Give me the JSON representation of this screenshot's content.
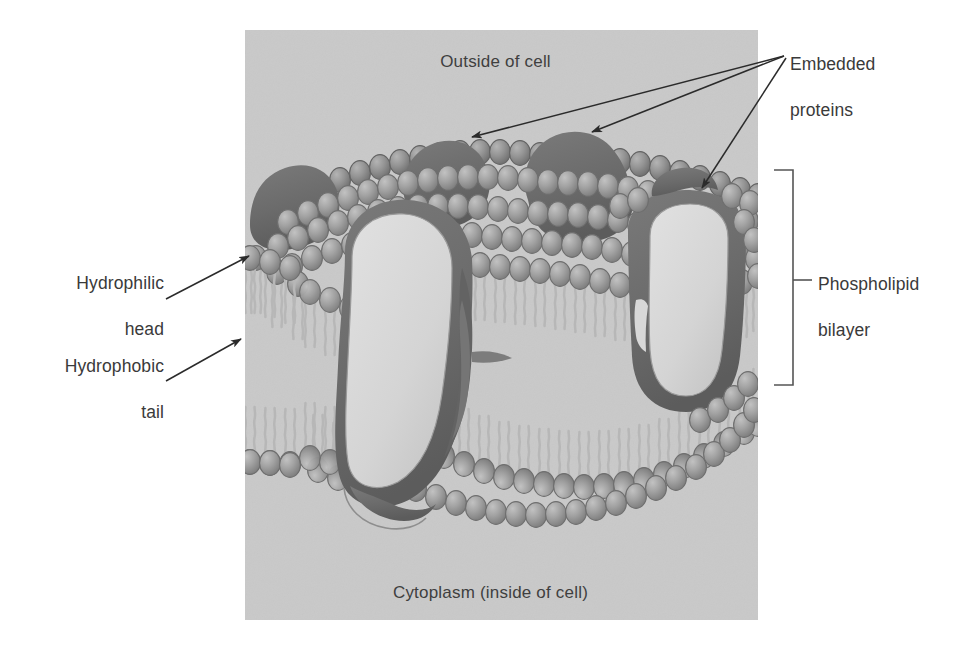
{
  "figure": {
    "panel": {
      "background_color": "#c9c9c9",
      "x": 245,
      "y": 30,
      "width": 513,
      "height": 590
    },
    "inner_labels": {
      "outside_of_cell": "Outside of cell",
      "cytoplasm": "Cytoplasm (inside of cell)"
    },
    "callouts": [
      {
        "id": "embedded-proteins",
        "text": "Embedded\nproteins",
        "line1": "Embedded",
        "line2": "proteins",
        "arrow_count": 3,
        "anchor_x": 786,
        "anchor_y": 54,
        "targets": [
          {
            "x": 468,
            "y": 135
          },
          {
            "x": 588,
            "y": 130
          },
          {
            "x": 700,
            "y": 185
          }
        ]
      },
      {
        "id": "phospholipid-bilayer",
        "text": "Phospholipid\nbilayer",
        "line1": "Phospholipid",
        "line2": "bilayer",
        "bracket": {
          "x": 790,
          "y_top": 170,
          "y_bottom": 385,
          "tick_y": 280
        }
      },
      {
        "id": "hydrophilic-head",
        "text": "Hydrophilic\nhead",
        "line1": "Hydrophilic",
        "line2": "head",
        "arrow_from": {
          "x": 168,
          "y": 298
        },
        "arrow_to": {
          "x": 253,
          "y": 258
        }
      },
      {
        "id": "hydrophobic-tail",
        "text": "Hydrophobic\ntail",
        "line1": "Hydrophobic",
        "line2": "tail",
        "arrow_from": {
          "x": 168,
          "y": 380
        },
        "arrow_to": {
          "x": 244,
          "y": 340
        }
      }
    ],
    "colors": {
      "panel_gray": "#c9c9c9",
      "head_fill": "#a0a0a0",
      "head_outline": "#6e6e6e",
      "tail_stroke": "#b9b9b9",
      "protein_dark": "#6b6b6b",
      "protein_channel_fill": "#d6d6d6",
      "label_text": "#3a3a3a",
      "arrow_stroke": "#2b2b2b",
      "bracket_stroke": "#555555"
    },
    "structures": {
      "phospholipid_heads_upper_count": 96,
      "phospholipid_heads_lower_count": 52,
      "embedded_protein_blobs": 4,
      "channel_proteins": 2,
      "bilayer_leaflets": 2
    }
  }
}
